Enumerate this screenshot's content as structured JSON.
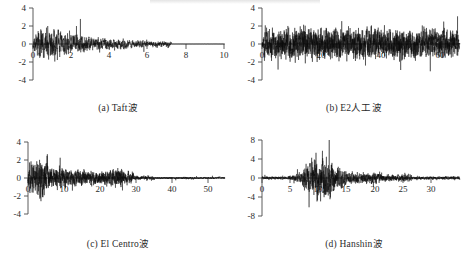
{
  "figure": {
    "background_color": "#ffffff",
    "line_color": "#0b0b0b",
    "axis_color": "#4a4a4a",
    "panels": [
      {
        "key": "a",
        "caption": "(a) Taft波",
        "chart_data": {
          "type": "line",
          "title": "(a) Taft波",
          "xlabel": "",
          "ylabel": "",
          "xlim": [
            0,
            10.6
          ],
          "ylim": [
            -4,
            4
          ],
          "xticks": [
            0,
            2,
            4,
            6,
            8,
            10
          ],
          "yticks": [
            -4,
            -2,
            0,
            2,
            4
          ],
          "xtick_labels": [
            "0",
            "2",
            "4",
            "6",
            "8",
            "10"
          ],
          "ytick_labels": [
            "-4",
            "-2",
            "0",
            "2",
            "4"
          ],
          "grid": false,
          "legend": "none",
          "series_name": "Taft acceleration record",
          "duration": 7.6,
          "peak_positive": 3.0,
          "peak_negative": -2.7,
          "envelope_note": "strong motion in first 2 s, decaying amplitude to ~7.6 s, flat thereafter"
        }
      },
      {
        "key": "b",
        "caption": "(b) E2人工波",
        "chart_data": {
          "type": "line",
          "title": "(b) E2人工波",
          "xlabel": "",
          "ylabel": "",
          "xlim": [
            0,
            66
          ],
          "ylim": [
            -4,
            4
          ],
          "xticks": [
            0,
            20,
            40,
            60
          ],
          "yticks": [
            -4,
            -2,
            0,
            2,
            4
          ],
          "xtick_labels": [
            "0",
            "20",
            "40",
            "60"
          ],
          "ytick_labels": [
            "-4",
            "-2",
            "0",
            "2",
            "4"
          ],
          "grid": false,
          "legend": "none",
          "series_name": "E2 artificial wave",
          "duration": 64,
          "peak_positive": 2.6,
          "peak_negative": -3.0,
          "envelope_note": "stationary broadband random motion across full duration"
        }
      },
      {
        "key": "c",
        "caption": "(c) El Centro波",
        "chart_data": {
          "type": "line",
          "title": "(c) El Centro波",
          "xlabel": "",
          "ylabel": "",
          "xlim": [
            0,
            56
          ],
          "ylim": [
            -4,
            4
          ],
          "xticks": [
            0,
            10,
            20,
            30,
            40,
            50
          ],
          "yticks": [
            -4,
            -2,
            0,
            2,
            4
          ],
          "xtick_labels": [
            "0",
            "10",
            "20",
            "30",
            "40",
            "50"
          ],
          "ytick_labels": [
            "-4",
            "-2",
            "0",
            "2",
            "4"
          ],
          "grid": false,
          "legend": "none",
          "series_name": "El Centro acceleration record",
          "duration": 54,
          "peak_positive": 3.2,
          "peak_negative": -3.8,
          "envelope_note": "intense burst 1-6 s, moderate 6-30 s, low amplitude tail to 54 s"
        }
      },
      {
        "key": "d",
        "caption": "(d) Hanshin波",
        "chart_data": {
          "type": "line",
          "title": "(d) Hanshin波",
          "xlabel": "",
          "ylabel": "",
          "xlim": [
            0,
            33
          ],
          "ylim": [
            -8,
            8
          ],
          "xticks": [
            0,
            5,
            10,
            15,
            20,
            25,
            30
          ],
          "yticks": [
            -8,
            -4,
            0,
            4,
            8
          ],
          "xtick_labels": [
            "0",
            "5",
            "10",
            "15",
            "20",
            "25",
            "30"
          ],
          "ytick_labels": [
            "-8",
            "-4",
            "0",
            "4",
            "8"
          ],
          "grid": false,
          "legend": "none",
          "series_name": "Hanshin (Kobe) acceleration record",
          "duration": 32,
          "peak_positive": 8.0,
          "peak_negative": -6.6,
          "envelope_note": "quiet start, dominant pulse 7-13 s reaching +8/-6.6, decaying tail to 32 s"
        }
      }
    ]
  }
}
